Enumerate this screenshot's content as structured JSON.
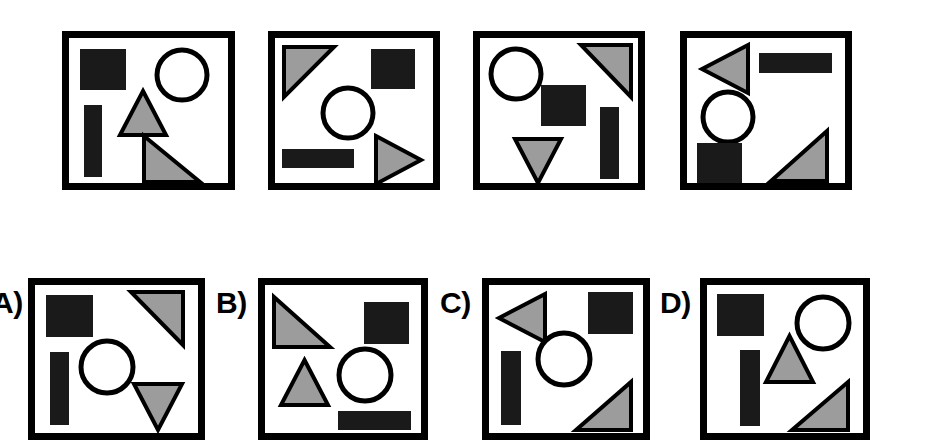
{
  "figure": {
    "kind": "visual-analogy-shape-puzzle",
    "background_color": "#ffffff",
    "outline_color": "#000000",
    "fill_black": "#1a1a1a",
    "fill_gray": "#9c9c9c",
    "fill_white": "#ffffff",
    "border_width_px": 7,
    "stroke_width_px": 4
  },
  "top_row": {
    "name": "reference-panels",
    "panels": [
      {
        "id": "top-panel-1",
        "box": {
          "x": 62,
          "y": 31,
          "w": 173,
          "h": 159
        },
        "shapes": [
          {
            "name": "black-square",
            "type": "rect",
            "fill": "black",
            "x": 18,
            "y": 18,
            "w": 46,
            "h": 41
          },
          {
            "name": "circle-outline",
            "type": "circle",
            "fill": "white",
            "cx": 120,
            "cy": 44,
            "r": 25
          },
          {
            "name": "black-vertical-bar",
            "type": "rect",
            "fill": "black",
            "x": 22,
            "y": 74,
            "w": 18,
            "h": 72
          },
          {
            "name": "gray-triangle-up",
            "type": "triangle-up",
            "fill": "gray",
            "x": 58,
            "y": 60,
            "w": 46,
            "h": 44
          },
          {
            "name": "gray-right-triangle",
            "type": "triangle-right-angle-bl",
            "fill": "gray",
            "x": 82,
            "y": 105,
            "w": 56,
            "h": 46
          }
        ]
      },
      {
        "id": "top-panel-2",
        "box": {
          "x": 268,
          "y": 31,
          "w": 172,
          "h": 159
        },
        "shapes": [
          {
            "name": "gray-right-triangle-tl",
            "type": "triangle-right-angle-tl",
            "fill": "gray",
            "x": 16,
            "y": 16,
            "w": 50,
            "h": 50
          },
          {
            "name": "black-square",
            "type": "rect",
            "fill": "black",
            "x": 103,
            "y": 18,
            "w": 44,
            "h": 40
          },
          {
            "name": "circle-outline",
            "type": "circle",
            "fill": "white",
            "cx": 80,
            "cy": 82,
            "r": 25
          },
          {
            "name": "black-horizontal-bar",
            "type": "rect",
            "fill": "black",
            "x": 14,
            "y": 118,
            "w": 72,
            "h": 19
          },
          {
            "name": "gray-triangle-right",
            "type": "triangle-right",
            "fill": "gray",
            "x": 108,
            "y": 105,
            "w": 45,
            "h": 48
          }
        ]
      },
      {
        "id": "top-panel-3",
        "box": {
          "x": 473,
          "y": 31,
          "w": 172,
          "h": 159
        },
        "shapes": [
          {
            "name": "circle-outline",
            "type": "circle",
            "fill": "white",
            "cx": 43,
            "cy": 43,
            "r": 25
          },
          {
            "name": "gray-right-triangle-tr",
            "type": "triangle-right-angle-tr",
            "fill": "gray",
            "x": 108,
            "y": 14,
            "w": 50,
            "h": 52
          },
          {
            "name": "black-square",
            "type": "rect",
            "fill": "black",
            "x": 68,
            "y": 54,
            "w": 45,
            "h": 41
          },
          {
            "name": "black-vertical-bar",
            "type": "rect",
            "fill": "black",
            "x": 127,
            "y": 76,
            "w": 19,
            "h": 72
          },
          {
            "name": "gray-triangle-down",
            "type": "triangle-down",
            "fill": "gray",
            "x": 42,
            "y": 108,
            "w": 46,
            "h": 44
          }
        ]
      },
      {
        "id": "top-panel-4",
        "box": {
          "x": 680,
          "y": 31,
          "w": 172,
          "h": 159
        },
        "shapes": [
          {
            "name": "gray-triangle-left",
            "type": "triangle-left",
            "fill": "gray",
            "x": 22,
            "y": 14,
            "w": 46,
            "h": 48
          },
          {
            "name": "black-horizontal-bar",
            "type": "rect",
            "fill": "black",
            "x": 79,
            "y": 22,
            "w": 73,
            "h": 20
          },
          {
            "name": "circle-outline",
            "type": "circle",
            "fill": "white",
            "cx": 48,
            "cy": 86,
            "r": 25
          },
          {
            "name": "black-square",
            "type": "rect",
            "fill": "black",
            "x": 17,
            "y": 112,
            "w": 45,
            "h": 40
          },
          {
            "name": "gray-right-triangle-br",
            "type": "triangle-right-angle-br",
            "fill": "gray",
            "x": 91,
            "y": 100,
            "w": 56,
            "h": 50
          }
        ]
      }
    ]
  },
  "bottom_row": {
    "name": "answer-options",
    "options": [
      {
        "id": "option-a",
        "label": "A)",
        "label_pos": {
          "x": -8,
          "y": 288
        },
        "box": {
          "x": 28,
          "y": 278,
          "w": 177,
          "h": 162
        },
        "shapes": [
          {
            "name": "black-square",
            "type": "rect",
            "fill": "black",
            "x": 18,
            "y": 17,
            "w": 47,
            "h": 42
          },
          {
            "name": "gray-right-triangle-tr",
            "type": "triangle-right-angle-tr",
            "fill": "gray",
            "x": 103,
            "y": 14,
            "w": 52,
            "h": 53
          },
          {
            "name": "black-vertical-bar",
            "type": "rect",
            "fill": "black",
            "x": 22,
            "y": 74,
            "w": 19,
            "h": 73
          },
          {
            "name": "circle-outline",
            "type": "circle",
            "fill": "white",
            "cx": 79,
            "cy": 89,
            "r": 26
          },
          {
            "name": "gray-triangle-down",
            "type": "triangle-down",
            "fill": "gray",
            "x": 106,
            "y": 106,
            "w": 48,
            "h": 46
          }
        ]
      },
      {
        "id": "option-b",
        "label": "B)",
        "label_pos": {
          "x": 216,
          "y": 288
        },
        "box": {
          "x": 258,
          "y": 278,
          "w": 170,
          "h": 162
        },
        "shapes": [
          {
            "name": "gray-right-triangle-bl",
            "type": "triangle-right-angle-bl",
            "fill": "gray",
            "x": 16,
            "y": 19,
            "w": 56,
            "h": 50
          },
          {
            "name": "black-square",
            "type": "rect",
            "fill": "black",
            "x": 106,
            "y": 24,
            "w": 45,
            "h": 42
          },
          {
            "name": "gray-triangle-up",
            "type": "triangle-up",
            "fill": "gray",
            "x": 23,
            "y": 82,
            "w": 47,
            "h": 45
          },
          {
            "name": "circle-outline",
            "type": "circle",
            "fill": "white",
            "cx": 107,
            "cy": 97,
            "r": 26
          },
          {
            "name": "black-horizontal-bar",
            "type": "rect",
            "fill": "black",
            "x": 80,
            "y": 133,
            "w": 73,
            "h": 19
          }
        ]
      },
      {
        "id": "option-c",
        "label": "C)",
        "label_pos": {
          "x": 440,
          "y": 288
        },
        "box": {
          "x": 482,
          "y": 278,
          "w": 168,
          "h": 162
        },
        "shapes": [
          {
            "name": "gray-triangle-left",
            "type": "triangle-left",
            "fill": "gray",
            "x": 17,
            "y": 16,
            "w": 46,
            "h": 48
          },
          {
            "name": "black-square",
            "type": "rect",
            "fill": "black",
            "x": 106,
            "y": 14,
            "w": 45,
            "h": 42
          },
          {
            "name": "black-vertical-bar",
            "type": "rect",
            "fill": "black",
            "x": 19,
            "y": 73,
            "w": 20,
            "h": 74
          },
          {
            "name": "circle-outline",
            "type": "circle",
            "fill": "white",
            "cx": 82,
            "cy": 81,
            "r": 26
          },
          {
            "name": "gray-right-triangle-br",
            "type": "triangle-right-angle-br",
            "fill": "gray",
            "x": 94,
            "y": 104,
            "w": 55,
            "h": 48
          }
        ]
      },
      {
        "id": "option-d",
        "label": "D)",
        "label_pos": {
          "x": 660,
          "y": 288
        },
        "box": {
          "x": 700,
          "y": 278,
          "w": 170,
          "h": 162
        },
        "shapes": [
          {
            "name": "black-square",
            "type": "rect",
            "fill": "black",
            "x": 17,
            "y": 16,
            "w": 47,
            "h": 42
          },
          {
            "name": "circle-outline",
            "type": "circle",
            "fill": "white",
            "cx": 123,
            "cy": 45,
            "r": 26
          },
          {
            "name": "black-vertical-bar",
            "type": "rect",
            "fill": "black",
            "x": 40,
            "y": 72,
            "w": 20,
            "h": 76
          },
          {
            "name": "gray-triangle-up",
            "type": "triangle-up",
            "fill": "gray",
            "x": 66,
            "y": 58,
            "w": 47,
            "h": 46
          },
          {
            "name": "gray-right-triangle-bl",
            "type": "triangle-right-angle-br",
            "fill": "gray",
            "x": 92,
            "y": 104,
            "w": 56,
            "h": 48
          }
        ]
      }
    ]
  }
}
